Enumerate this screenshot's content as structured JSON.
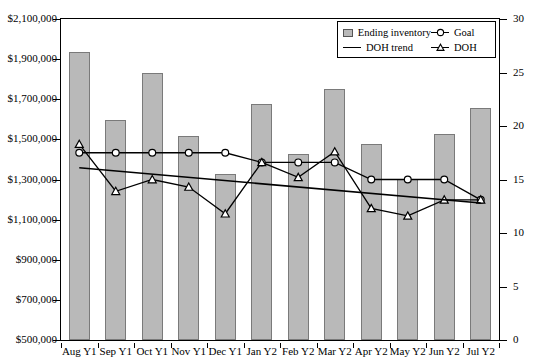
{
  "chart_data": {
    "type": "bar",
    "title": "",
    "xlabel": "",
    "ylabel": "",
    "categories": [
      "Aug Y1",
      "Sep Y1",
      "Oct Y1",
      "Nov Y1",
      "Dec Y1",
      "Jan Y2",
      "Feb Y2",
      "Mar Y2",
      "Apr Y2",
      "May Y2",
      "Jun Y2",
      "Jul Y2"
    ],
    "grid": false,
    "legend_position": "top-right",
    "axes": {
      "left": {
        "label": "",
        "ylim": [
          500000,
          2100000
        ],
        "tick_step": 200000,
        "ticks": [
          500000,
          700000,
          900000,
          1100000,
          1300000,
          1500000,
          1700000,
          1900000,
          2100000
        ],
        "tick_labels": [
          "$500,000",
          "$700,000",
          "$900,000",
          "$1,100,000",
          "$1,300,000",
          "$1,500,000",
          "$1,700,000",
          "$1,900,000",
          "$2,100,000"
        ]
      },
      "right": {
        "label": "",
        "ylim": [
          0,
          30
        ],
        "tick_step": 5,
        "ticks": [
          0,
          5,
          10,
          15,
          20,
          25,
          30
        ],
        "tick_labels": [
          "0",
          "5",
          "10",
          "15",
          "20",
          "25",
          "30"
        ]
      }
    },
    "series": [
      {
        "name": "Ending inventory",
        "type": "bar",
        "axis": "left",
        "color": "#b9b9b9",
        "border_color": "#7a7a7a",
        "values": [
          1935000,
          1597000,
          1830000,
          1515000,
          1325000,
          1675000,
          1425000,
          1752000,
          1477000,
          1302000,
          1527000,
          1655000
        ]
      },
      {
        "name": "Goal",
        "type": "line",
        "axis": "right",
        "marker": "circle",
        "color": "#000000",
        "values": [
          17.5,
          17.5,
          17.5,
          17.5,
          17.5,
          16.6,
          16.6,
          16.6,
          15.0,
          15.0,
          15.0,
          13.1
        ]
      },
      {
        "name": "DOH",
        "type": "line",
        "axis": "right",
        "marker": "triangle",
        "color": "#000000",
        "values": [
          18.3,
          13.9,
          15.0,
          14.3,
          11.8,
          16.6,
          15.2,
          17.6,
          12.3,
          11.6,
          13.1,
          13.1
        ]
      },
      {
        "name": "DOH trend",
        "type": "line",
        "axis": "right",
        "marker": "none",
        "color": "#000000",
        "values": [
          16.1,
          15.8,
          15.5,
          15.2,
          14.9,
          14.6,
          14.3,
          14.0,
          13.7,
          13.4,
          13.1,
          12.8
        ]
      }
    ]
  },
  "legend": {
    "items": [
      {
        "label": "Ending inventory",
        "marker": "bar-swatch"
      },
      {
        "label": "Goal",
        "marker": "circle-marker"
      },
      {
        "label": "DOH trend",
        "marker": "plain-line"
      },
      {
        "label": "DOH",
        "marker": "triangle-marker"
      }
    ]
  }
}
